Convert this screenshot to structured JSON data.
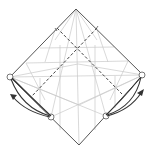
{
  "diagram": {
    "title": "Origami fold step diagram",
    "type": "origami-crease-pattern",
    "paper_outline": {
      "top": [
        76,
        9
      ],
      "left": [
        10,
        77
      ],
      "right": [
        143,
        75
      ],
      "bottom": [
        79,
        145
      ],
      "color": "#555555"
    },
    "crease_color": "#c8c8c8",
    "valley_fold_color": "#444444",
    "arrow_color": "#333333",
    "reference_points": [
      {
        "name": "left-corner",
        "pos": [
          10,
          77
        ]
      },
      {
        "name": "right-corner",
        "pos": [
          142,
          75
        ]
      },
      {
        "name": "bottom-left-point",
        "pos": [
          51,
          117
        ]
      },
      {
        "name": "bottom-right-point",
        "pos": [
          106,
          116
        ]
      }
    ],
    "arrows": [
      {
        "name": "fold-arrow-left",
        "direction": "up-left"
      },
      {
        "name": "fold-arrow-right",
        "direction": "up-right"
      }
    ],
    "labels": []
  }
}
